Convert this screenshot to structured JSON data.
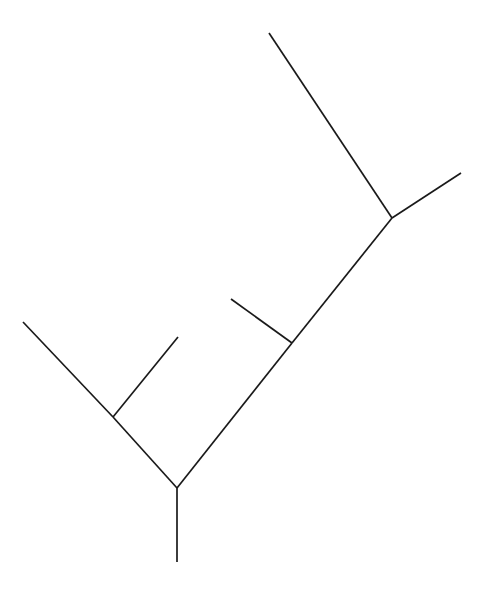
{
  "figure": {
    "name": "phylogenetic-tree-diagram",
    "type": "unrooted-tree-cladogram",
    "background_color": "#ffffff",
    "line_color": "#1a1a1a",
    "line_width": 1.7,
    "width": 490,
    "height": 600,
    "title": "",
    "caption": "",
    "labels": []
  },
  "chart_data": {
    "type": "tree",
    "title": "",
    "xlabel": "",
    "ylabel": "",
    "grid": false,
    "legend": null,
    "xlim": [
      0,
      490
    ],
    "ylim": [
      0,
      600
    ],
    "stroke_color": "#1a1a1a",
    "stroke_width": 1.7,
    "nodes": [
      {
        "id": "root",
        "label": "",
        "x": 177,
        "y": 488,
        "kind": "internal"
      },
      {
        "id": "node-left",
        "label": "",
        "x": 113,
        "y": 417,
        "kind": "internal"
      },
      {
        "id": "node-mid",
        "label": "",
        "x": 292,
        "y": 343,
        "kind": "internal"
      },
      {
        "id": "node-upper",
        "label": "",
        "x": 392,
        "y": 218,
        "kind": "internal"
      },
      {
        "id": "tip-stem",
        "label": "",
        "x": 177,
        "y": 562,
        "kind": "leaf"
      },
      {
        "id": "tip-far-left",
        "label": "",
        "x": 23,
        "y": 322,
        "kind": "leaf"
      },
      {
        "id": "tip-left-in",
        "label": "",
        "x": 178,
        "y": 337,
        "kind": "leaf"
      },
      {
        "id": "tip-mid-in",
        "label": "",
        "x": 231,
        "y": 299,
        "kind": "leaf"
      },
      {
        "id": "tip-top",
        "label": "",
        "x": 269,
        "y": 33,
        "kind": "leaf"
      },
      {
        "id": "tip-right",
        "label": "",
        "x": 461,
        "y": 173,
        "kind": "leaf"
      }
    ],
    "edges": [
      {
        "id": "edge-root-stem",
        "from": "root",
        "to": "tip-stem",
        "x1": 177,
        "y1": 488,
        "x2": 177,
        "y2": 562
      },
      {
        "id": "edge-root-left",
        "from": "root",
        "to": "node-left",
        "x1": 177,
        "y1": 488,
        "x2": 113,
        "y2": 417
      },
      {
        "id": "edge-left-far",
        "from": "node-left",
        "to": "tip-far-left",
        "x1": 113,
        "y1": 417,
        "x2": 23,
        "y2": 322
      },
      {
        "id": "edge-left-inner",
        "from": "node-left",
        "to": "tip-left-in",
        "x1": 113,
        "y1": 417,
        "x2": 178,
        "y2": 337
      },
      {
        "id": "edge-root-mid",
        "from": "root",
        "to": "node-mid",
        "x1": 177,
        "y1": 488,
        "x2": 292,
        "y2": 343
      },
      {
        "id": "edge-mid-inner",
        "from": "node-mid",
        "to": "tip-mid-in",
        "x1": 292,
        "y1": 343,
        "x2": 231,
        "y2": 299
      },
      {
        "id": "edge-mid-upper",
        "from": "node-mid",
        "to": "node-upper",
        "x1": 292,
        "y1": 343,
        "x2": 392,
        "y2": 218
      },
      {
        "id": "edge-upper-top",
        "from": "node-upper",
        "to": "tip-top",
        "x1": 392,
        "y1": 218,
        "x2": 269,
        "y2": 33
      },
      {
        "id": "edge-upper-right",
        "from": "node-upper",
        "to": "tip-right",
        "x1": 392,
        "y1": 218,
        "x2": 461,
        "y2": 173
      }
    ]
  }
}
